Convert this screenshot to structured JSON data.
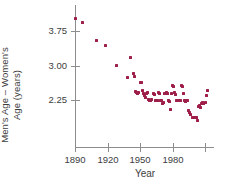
{
  "chart_data": {
    "type": "scatter",
    "title": "",
    "xlabel": "Year",
    "ylabel": "Men's Age – Women's Age (years)",
    "ylabel_line1": "Men's Age – Women's",
    "ylabel_line2": "Age (years)",
    "marker_color": "#9E1F4A",
    "axis_color": "#8D8D8D",
    "grid": false,
    "legend": null,
    "xlim": [
      1886,
      2008
    ],
    "ylim": [
      1.74,
      4.08
    ],
    "xticks": [
      1890,
      1920,
      1950,
      1980,
      2010
    ],
    "xtick_labels": [
      "1890",
      "1920",
      "1950",
      "1980",
      ""
    ],
    "yticks": [
      2.25,
      3.0,
      3.75
    ],
    "ytick_labels": [
      "2.25",
      "3.00",
      "3.75"
    ],
    "points": [
      [
        1890,
        4.02
      ],
      [
        1897,
        3.93
      ],
      [
        1910,
        3.54
      ],
      [
        1918,
        3.44
      ],
      [
        1928,
        3.01
      ],
      [
        1938,
        2.73
      ],
      [
        1941,
        3.17
      ],
      [
        1944,
        2.83
      ],
      [
        1945,
        2.77
      ],
      [
        1946,
        2.43
      ],
      [
        1947,
        2.42
      ],
      [
        1948,
        2.4
      ],
      [
        1949,
        2.41
      ],
      [
        1950,
        2.64
      ],
      [
        1951,
        2.62
      ],
      [
        1952,
        2.45
      ],
      [
        1953,
        2.4
      ],
      [
        1954,
        2.35
      ],
      [
        1955,
        2.3
      ],
      [
        1956,
        2.39
      ],
      [
        1957,
        2.41
      ],
      [
        1958,
        2.26
      ],
      [
        1959,
        2.25
      ],
      [
        1960,
        2.25
      ],
      [
        1961,
        2.27
      ],
      [
        1962,
        2.39
      ],
      [
        1963,
        2.38
      ],
      [
        1964,
        2.25
      ],
      [
        1965,
        2.24
      ],
      [
        1966,
        2.25
      ],
      [
        1967,
        2.41
      ],
      [
        1968,
        2.4
      ],
      [
        1969,
        2.25
      ],
      [
        1970,
        2.23
      ],
      [
        1971,
        2.18
      ],
      [
        1972,
        2.19
      ],
      [
        1973,
        2.4
      ],
      [
        1974,
        2.41
      ],
      [
        1975,
        2.39
      ],
      [
        1976,
        2.24
      ],
      [
        1977,
        2.22
      ],
      [
        1978,
        2.05
      ],
      [
        1979,
        2.4
      ],
      [
        1980,
        2.56
      ],
      [
        1981,
        2.55
      ],
      [
        1982,
        2.41
      ],
      [
        1983,
        2.38
      ],
      [
        1984,
        2.25
      ],
      [
        1985,
        2.25
      ],
      [
        1986,
        2.24
      ],
      [
        1987,
        2.23
      ],
      [
        1988,
        2.56
      ],
      [
        1989,
        2.55
      ],
      [
        1990,
        2.4
      ],
      [
        1991,
        2.24
      ],
      [
        1992,
        2.22
      ],
      [
        1993,
        2.23
      ],
      [
        1994,
        2.25
      ],
      [
        1995,
        2.02
      ],
      [
        1996,
        1.97
      ],
      [
        1997,
        1.93
      ],
      [
        1998,
        1.88
      ],
      [
        1999,
        1.87
      ],
      [
        2000,
        1.87
      ],
      [
        2001,
        1.88
      ],
      [
        2002,
        1.86
      ],
      [
        2003,
        1.8
      ],
      [
        2004,
        2.1
      ],
      [
        2005,
        2.12
      ],
      [
        2006,
        2.08
      ],
      [
        2007,
        2.18
      ],
      [
        2008,
        2.2
      ],
      [
        2009,
        2.17
      ],
      [
        2010,
        2.2
      ],
      [
        2011,
        2.35
      ],
      [
        2012,
        2.46
      ]
    ]
  }
}
